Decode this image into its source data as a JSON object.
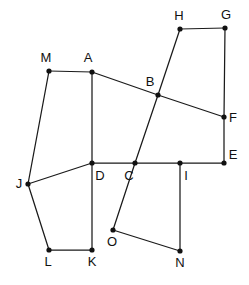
{
  "figure": {
    "width": 249,
    "height": 285,
    "background_color": "#ffffff",
    "line_color": "#1a1a1a",
    "vertex_color": "#111111",
    "label_color": "#111111",
    "line_width": 1.25,
    "vertex_radius": 2.6,
    "label_font_size": 13,
    "points": [
      {
        "id": "A",
        "label": "A",
        "x": 92,
        "y": 72,
        "lx": 88,
        "ly": 62
      },
      {
        "id": "B",
        "label": "B",
        "x": 158,
        "y": 95,
        "lx": 150,
        "ly": 86
      },
      {
        "id": "C",
        "label": "C",
        "x": 135,
        "y": 163,
        "lx": 129,
        "ly": 180
      },
      {
        "id": "D",
        "label": "D",
        "x": 92,
        "y": 163,
        "lx": 100,
        "ly": 180
      },
      {
        "id": "E",
        "label": "E",
        "x": 224,
        "y": 163,
        "lx": 233,
        "ly": 159
      },
      {
        "id": "F",
        "label": "F",
        "x": 224,
        "y": 117,
        "lx": 233,
        "ly": 122
      },
      {
        "id": "G",
        "label": "G",
        "x": 225,
        "y": 28,
        "lx": 226,
        "ly": 19
      },
      {
        "id": "H",
        "label": "H",
        "x": 180,
        "y": 29,
        "lx": 179,
        "ly": 20
      },
      {
        "id": "I",
        "label": "I",
        "x": 180,
        "y": 163,
        "lx": 186,
        "ly": 180
      },
      {
        "id": "J",
        "label": "J",
        "x": 28,
        "y": 184,
        "lx": 19,
        "ly": 188
      },
      {
        "id": "K",
        "label": "K",
        "x": 92,
        "y": 250,
        "lx": 92,
        "ly": 266
      },
      {
        "id": "L",
        "label": "L",
        "x": 49,
        "y": 250,
        "lx": 48,
        "ly": 266
      },
      {
        "id": "M",
        "label": "M",
        "x": 49,
        "y": 71,
        "lx": 46,
        "ly": 62
      },
      {
        "id": "N",
        "label": "N",
        "x": 180,
        "y": 251,
        "lx": 180,
        "ly": 267
      },
      {
        "id": "O",
        "label": "O",
        "x": 113,
        "y": 230,
        "lx": 112,
        "ly": 246
      }
    ],
    "segments": [
      {
        "from": "M",
        "to": "A"
      },
      {
        "from": "M",
        "to": "J"
      },
      {
        "from": "A",
        "to": "B"
      },
      {
        "from": "B",
        "to": "F"
      },
      {
        "from": "A",
        "to": "D"
      },
      {
        "from": "D",
        "to": "K"
      },
      {
        "from": "J",
        "to": "D"
      },
      {
        "from": "J",
        "to": "L"
      },
      {
        "from": "L",
        "to": "K"
      },
      {
        "from": "D",
        "to": "C"
      },
      {
        "from": "C",
        "to": "I"
      },
      {
        "from": "I",
        "to": "E"
      },
      {
        "from": "E",
        "to": "F"
      },
      {
        "from": "F",
        "to": "G"
      },
      {
        "from": "G",
        "to": "H"
      },
      {
        "from": "H",
        "to": "B"
      },
      {
        "from": "B",
        "to": "C"
      },
      {
        "from": "C",
        "to": "O"
      },
      {
        "from": "O",
        "to": "N"
      },
      {
        "from": "N",
        "to": "I"
      }
    ]
  }
}
